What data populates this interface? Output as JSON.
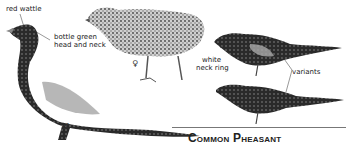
{
  "title": "Common Pheasant",
  "labels": {
    "red_wattle": "red wattle",
    "bottle_green_1": "bottle green",
    "bottle_green_2": "head and neck",
    "white_ring_1": "white",
    "white_ring_2": "neck ring",
    "variants": "variants"
  },
  "symbols": {
    "female": "♀",
    "male": "♂"
  }
}
